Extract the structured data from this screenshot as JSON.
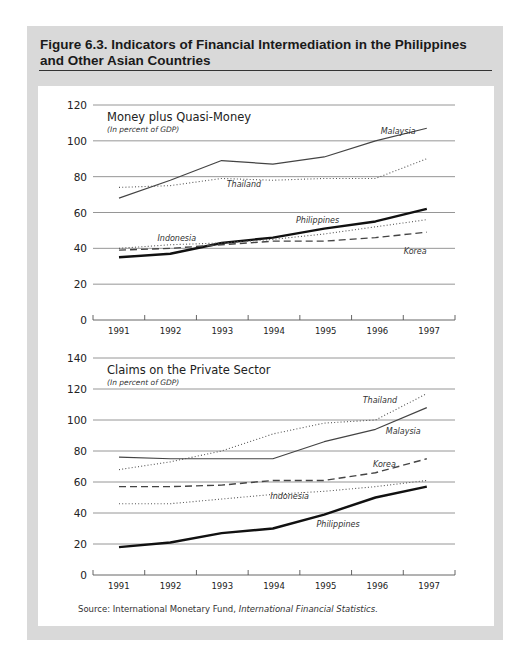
{
  "figure": {
    "title": "Figure 6.3.  Indicators of Financial Intermediation in the Philippines and Other Asian Countries",
    "source_label": "Source:  International Monetary Fund, ",
    "source_italic": "International Financial Statistics."
  },
  "chart_data": [
    {
      "type": "line",
      "title": "Money plus Quasi-Money",
      "subtitle": "(In percent of GDP)",
      "xlabel": "",
      "ylabel": "",
      "x": [
        1991,
        1992,
        1993,
        1994,
        1995,
        1996,
        1997
      ],
      "ylim": [
        0,
        120
      ],
      "yticks": [
        0,
        20,
        40,
        60,
        80,
        100,
        120
      ],
      "grid": true,
      "legend": "inline labels",
      "series": [
        {
          "name": "Malaysia",
          "style": "solid",
          "values": [
            68,
            78,
            89,
            87,
            91,
            100,
            107
          ]
        },
        {
          "name": "Thailand",
          "style": "dotted",
          "values": [
            74,
            75,
            79,
            78,
            79,
            79,
            90
          ]
        },
        {
          "name": "Philippines",
          "style": "solid-bold",
          "values": [
            35,
            37,
            43,
            46,
            51,
            55,
            62
          ]
        },
        {
          "name": "Indonesia",
          "style": "dotted",
          "values": [
            40,
            42,
            43,
            45,
            48,
            52,
            56
          ]
        },
        {
          "name": "Korea",
          "style": "dashed",
          "values": [
            39,
            40,
            42,
            44,
            44,
            46,
            49
          ]
        }
      ],
      "labels": [
        {
          "text": "Malaysia",
          "x": 1996.1,
          "y": 104
        },
        {
          "text": "Thailand",
          "x": 1993.1,
          "y": 74
        },
        {
          "text": "Philippines",
          "x": 1994.45,
          "y": 54
        },
        {
          "text": "Indonesia",
          "x": 1991.75,
          "y": 44
        },
        {
          "text": "Korea",
          "x": 1996.55,
          "y": 37
        }
      ]
    },
    {
      "type": "line",
      "title": "Claims on the Private Sector",
      "subtitle": "(In percent of GDP)",
      "xlabel": "",
      "ylabel": "",
      "x": [
        1991,
        1992,
        1993,
        1994,
        1995,
        1996,
        1997
      ],
      "ylim": [
        0,
        140
      ],
      "yticks": [
        0,
        20,
        40,
        60,
        80,
        100,
        120,
        140
      ],
      "grid": true,
      "legend": "inline labels",
      "series": [
        {
          "name": "Thailand",
          "style": "dotted",
          "values": [
            68,
            73,
            80,
            91,
            98,
            100,
            117
          ]
        },
        {
          "name": "Malaysia",
          "style": "solid",
          "values": [
            76,
            75,
            75,
            75,
            86,
            94,
            108
          ]
        },
        {
          "name": "Korea",
          "style": "dashed",
          "values": [
            57,
            57,
            58,
            61,
            61,
            66,
            75
          ]
        },
        {
          "name": "Indonesia",
          "style": "dotted",
          "values": [
            46,
            46,
            49,
            52,
            54,
            57,
            61
          ]
        },
        {
          "name": "Philippines",
          "style": "solid-bold",
          "values": [
            18,
            21,
            27,
            30,
            39,
            50,
            57
          ]
        }
      ],
      "labels": [
        {
          "text": "Thailand",
          "x": 1995.75,
          "y": 111
        },
        {
          "text": "Malaysia",
          "x": 1996.2,
          "y": 91
        },
        {
          "text": "Korea",
          "x": 1995.95,
          "y": 70
        },
        {
          "text": "Indonesia",
          "x": 1993.95,
          "y": 49
        },
        {
          "text": "Philippines",
          "x": 1994.85,
          "y": 31
        }
      ]
    }
  ]
}
